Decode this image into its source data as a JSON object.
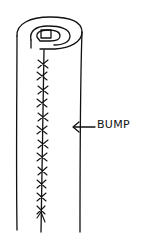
{
  "diagram": {
    "labels": {
      "bump": "BUMP"
    },
    "colors": {
      "ink": "#111111",
      "background": "#ffffff"
    }
  }
}
